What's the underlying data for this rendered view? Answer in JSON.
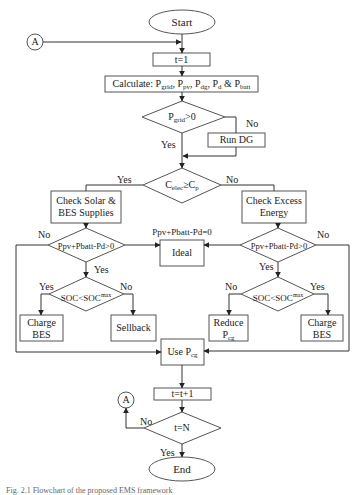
{
  "nodes": {
    "start": "Start",
    "init_t": "t=1",
    "calculate": {
      "prefix": "Calculate: P",
      "grid": "grid",
      "pv": "pv",
      "dg": "dg",
      "d": "d",
      "batt": "batt"
    },
    "decision_grid": {
      "p": "P",
      "sub": "grid",
      "rest": ">0"
    },
    "run_dg": "Run DG",
    "decision_celec": {
      "c": "C",
      "sub1": "elec",
      "mid": "≥C",
      "sub2": "p"
    },
    "check_solar": [
      "Check Solar &",
      "BES Supplies"
    ],
    "check_excess": [
      "Check Excess",
      "Energy"
    ],
    "balance_label": "Ppv+Pbatt-Pd=0",
    "ideal": "Ideal",
    "decision_left": "Ppv+Pbatt-Pd>0",
    "decision_right": "Ppv+Pbatt-Pd>0",
    "soc_left": {
      "soc": "SOC<SOC",
      "sup": "max"
    },
    "soc_right": {
      "soc": "SOC<SOC",
      "sup": "max"
    },
    "charge_bes_left": [
      "Charge",
      "BES"
    ],
    "sellback": "Sellback",
    "reduce_pcg": {
      "line1": "Reduce",
      "p": "P",
      "sub": "cg"
    },
    "charge_bes_right": [
      "Charge",
      "BES"
    ],
    "use_pcg": {
      "prefix": "Use P",
      "sub": "cg"
    },
    "increment_t": "t=t+1",
    "decision_tn": "t=N",
    "end": "End",
    "connector_top": "A",
    "connector_bottom": "A"
  },
  "edge_labels": {
    "yes": "Yes",
    "no": "No"
  },
  "caption": "Fig. 2.1  Flowchart of the proposed EMS framework"
}
